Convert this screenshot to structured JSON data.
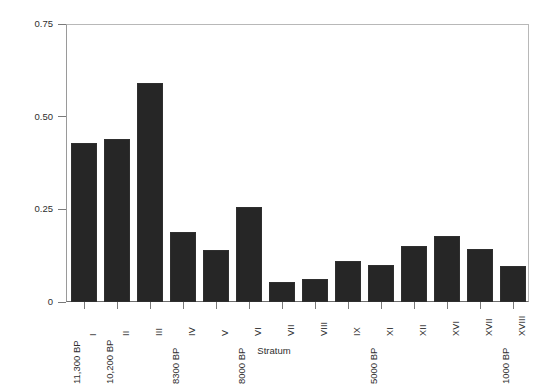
{
  "chart_data": {
    "type": "bar",
    "title": "",
    "xlabel": "Stratum",
    "ylabel": "Percent of Specimens per Stratum",
    "categories": [
      "I",
      "II",
      "III",
      "IV",
      "V",
      "VI",
      "VII",
      "VIII",
      "IX",
      "XI",
      "XII",
      "XVI",
      "XVII",
      "XVIII"
    ],
    "values": [
      0.43,
      0.44,
      0.59,
      0.19,
      0.14,
      0.255,
      0.054,
      0.062,
      0.11,
      0.1,
      0.15,
      0.177,
      0.142,
      0.097
    ],
    "ylim": [
      0,
      0.75
    ],
    "ytick_values": [
      0,
      0.25,
      0.5,
      0.75
    ],
    "ytick_labels": [
      "0",
      "0.25",
      "0.50",
      "0.75"
    ],
    "grid": false,
    "legend": null,
    "bar_color": "#262626",
    "annotations": [
      {
        "label": "11,300 BP",
        "category": "I",
        "side": "left"
      },
      {
        "label": "10,200 BP",
        "category": "II",
        "side": "left"
      },
      {
        "label": "8300 BP",
        "category": "IV",
        "side": "left"
      },
      {
        "label": "8000 BP",
        "category": "VI",
        "side": "left"
      },
      {
        "label": "5000 BP",
        "category": "XI",
        "side": "left"
      },
      {
        "label": "1000 BP",
        "category": "XVIII",
        "side": "left"
      }
    ]
  }
}
